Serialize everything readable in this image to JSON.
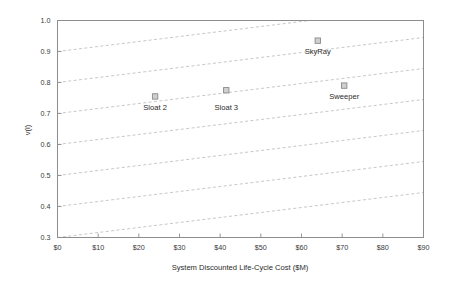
{
  "chart_data": {
    "type": "scatter",
    "title": "",
    "xlabel": "System Discounted Life-Cycle Cost ($M)",
    "ylabel": "v(i)",
    "xlim": [
      0,
      90
    ],
    "ylim": [
      0.3,
      1.0
    ],
    "grid": false,
    "legend": "none",
    "xticks": [
      0,
      10,
      20,
      30,
      40,
      50,
      60,
      70,
      80,
      90
    ],
    "xtick_labels": [
      "$0",
      "$10",
      "$20",
      "$30",
      "$40",
      "$50",
      "$60",
      "$70",
      "$80",
      "$90"
    ],
    "yticks": [
      0.3,
      0.4,
      0.5,
      0.6,
      0.7,
      0.8,
      0.9,
      1.0
    ],
    "ytick_labels": [
      "0.3",
      "0.4",
      "0.5",
      "0.6",
      "0.7",
      "0.8",
      "0.9",
      "1.0"
    ],
    "points": [
      {
        "label": "Sloat 2",
        "x": 24.0,
        "y": 0.755
      },
      {
        "label": "Sloat 3",
        "x": 41.5,
        "y": 0.775
      },
      {
        "label": "SkyRay",
        "x": 64.0,
        "y": 0.935
      },
      {
        "label": "Sweeper",
        "x": 70.5,
        "y": 0.79
      }
    ],
    "annotations": [
      {
        "text": "Sloat 2",
        "x": 24.0,
        "y": 0.712
      },
      {
        "text": "Sloat 3",
        "x": 41.5,
        "y": 0.712
      },
      {
        "text": "SkyRay",
        "x": 64.0,
        "y": 0.893
      },
      {
        "text": "Sweeper",
        "x": 70.5,
        "y": 0.747
      }
    ],
    "isovalue_lines": {
      "description": "dashed iso-preference lines, slope 0.1 value per $62M cost",
      "slope_per_dollar_m": 0.0016129,
      "intercepts_at_x0": [
        0.3,
        0.4,
        0.5,
        0.6,
        0.7,
        0.8,
        0.9
      ]
    },
    "colors": {
      "marker_fill": "#cfcfcf",
      "marker_stroke": "#8a8a8a",
      "isoline": "#b9b9b9",
      "axis": "#8d8d8d",
      "text": "#2b2b2b",
      "background": "#ffffff"
    }
  }
}
